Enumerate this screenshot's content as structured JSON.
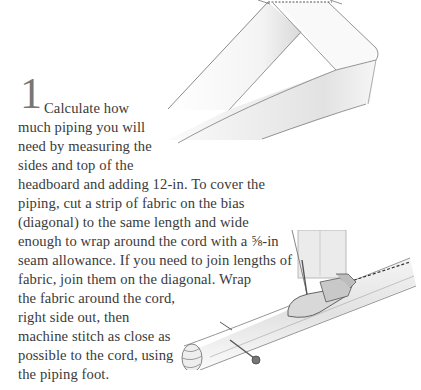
{
  "step": {
    "number": "1",
    "lines": [
      "Calculate how",
      "much piping you will",
      "need by measuring the",
      "sides and top of the",
      "headboard and adding 12-in. To cover the",
      "piping, cut a strip of fabric on the bias",
      "(diagonal) to the same length and wide",
      "enough to wrap around the cord with a ⅝-in",
      "seam allowance. If you need to join lengths of",
      "fabric, join them on the diagonal. Wrap",
      "the fabric around the cord,",
      "right side out, then",
      "machine stitch as close as",
      "possible to the cord, using",
      "the piping foot."
    ]
  },
  "illustrations": {
    "top": "bias-strip-joined-diagonally",
    "bottom": "piping-foot-stitching-cord"
  }
}
